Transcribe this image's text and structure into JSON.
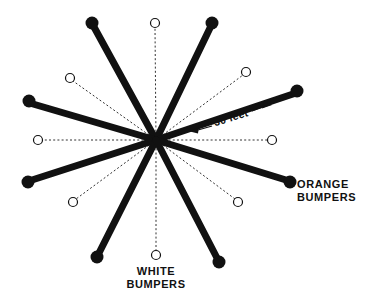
{
  "diagram": {
    "title_hidden": "",
    "background_color": "#ffffff",
    "ink_color": "#111111",
    "center": {
      "x": 156,
      "y": 140
    },
    "labels": {
      "orange_bumpers_line1": "ORANGE",
      "orange_bumpers_line2": "BUMPERS",
      "white_bumpers_line1": "WHITE",
      "white_bumpers_line2": "BUMPERS",
      "measure": "30 feet"
    },
    "orange_spokes": [
      {
        "name": "spoke-nnw",
        "x": 92,
        "y": 23,
        "dot_r": 6.5
      },
      {
        "name": "spoke-nne",
        "x": 212,
        "y": 23,
        "dot_r": 6.5
      },
      {
        "name": "spoke-wnw",
        "x": 29,
        "y": 101,
        "dot_r": 6.5
      },
      {
        "name": "spoke-ene",
        "x": 297,
        "y": 91,
        "dot_r": 6.5
      },
      {
        "name": "spoke-wsw",
        "x": 28,
        "y": 182,
        "dot_r": 6.5
      },
      {
        "name": "spoke-ese",
        "x": 290,
        "y": 182,
        "dot_r": 6.5
      },
      {
        "name": "spoke-ssw",
        "x": 97,
        "y": 257,
        "dot_r": 6.5
      },
      {
        "name": "spoke-sse",
        "x": 219,
        "y": 262,
        "dot_r": 6.5
      }
    ],
    "white_spokes": [
      {
        "name": "white-n",
        "x": 155,
        "y": 23,
        "circle_r": 4.5
      },
      {
        "name": "white-nw",
        "x": 70,
        "y": 78,
        "circle_r": 4.5
      },
      {
        "name": "white-ne",
        "x": 246,
        "y": 72,
        "circle_r": 4.5
      },
      {
        "name": "white-w",
        "x": 38,
        "y": 140,
        "circle_r": 4.5
      },
      {
        "name": "white-e",
        "x": 272,
        "y": 140,
        "circle_r": 4.5
      },
      {
        "name": "white-sw",
        "x": 73,
        "y": 202,
        "circle_r": 4.5
      },
      {
        "name": "white-se",
        "x": 238,
        "y": 202,
        "circle_r": 4.5
      },
      {
        "name": "white-s",
        "x": 156,
        "y": 255,
        "circle_r": 4.5
      }
    ],
    "measurement": {
      "value": "30 feet",
      "from": {
        "x": 190,
        "y": 131
      },
      "to": {
        "x": 272,
        "y": 105
      },
      "text_x": 232,
      "text_y": 121,
      "rotation_deg": -17
    }
  }
}
